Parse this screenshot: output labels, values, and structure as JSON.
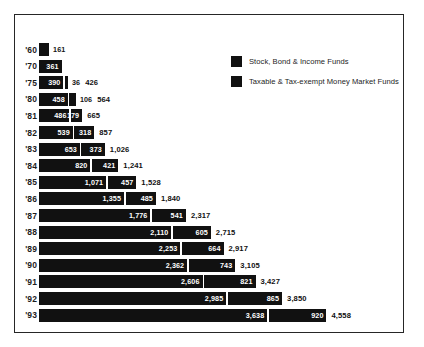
{
  "chart_data": {
    "type": "bar",
    "orientation": "horizontal",
    "stacked": true,
    "title": "",
    "xlabel": "",
    "ylabel": "",
    "grid": false,
    "legend_position": "top-right",
    "categories": [
      "'60",
      "'70",
      "'75",
      "'80",
      "'81",
      "'82",
      "'83",
      "'84",
      "'85",
      "'86",
      "'87",
      "'88",
      "'89",
      "'90",
      "'91",
      "'92",
      "'93"
    ],
    "series": [
      {
        "name": "Stock, Bond & Income Funds",
        "color": "#111111",
        "values": [
          161,
          361,
          390,
          458,
          486,
          539,
          653,
          820,
          1071,
          1355,
          1776,
          2110,
          2253,
          2362,
          2606,
          2985,
          3638
        ]
      },
      {
        "name": "Taxable & Tax-exempt Money Market Funds",
        "color": "#111111",
        "values": [
          null,
          null,
          36,
          106,
          179,
          318,
          373,
          421,
          457,
          485,
          541,
          605,
          664,
          743,
          821,
          865,
          920
        ]
      }
    ],
    "totals": [
      161,
      361,
      426,
      564,
      665,
      857,
      1026,
      1241,
      1528,
      1840,
      2317,
      2715,
      2917,
      3105,
      3427,
      3850,
      4558
    ],
    "xlim": [
      0,
      4558
    ]
  },
  "legend": {
    "items": [
      {
        "label": "Stock, Bond & Income Funds"
      },
      {
        "label": "Taxable & Tax-exempt Money Market Funds"
      }
    ]
  },
  "rows": [
    {
      "year": "'60",
      "v1": "161",
      "v2": "",
      "total": "",
      "v1_inside": false,
      "v2_inside": false,
      "show_total": false
    },
    {
      "year": "'70",
      "v1": "361",
      "v2": "",
      "total": "",
      "v1_inside": true,
      "v2_inside": false,
      "show_total": false
    },
    {
      "year": "'75",
      "v1": "390",
      "v2": "36",
      "total": "426",
      "v1_inside": true,
      "v2_inside": false,
      "show_total": true
    },
    {
      "year": "'80",
      "v1": "458",
      "v2": "106",
      "total": "564",
      "v1_inside": true,
      "v2_inside": false,
      "show_total": true
    },
    {
      "year": "'81",
      "v1": "486",
      "v2": "179",
      "total": "665",
      "v1_inside": true,
      "v2_inside": true,
      "show_total": true
    },
    {
      "year": "'82",
      "v1": "539",
      "v2": "318",
      "total": "857",
      "v1_inside": true,
      "v2_inside": true,
      "show_total": true
    },
    {
      "year": "'83",
      "v1": "653",
      "v2": "373",
      "total": "1,026",
      "v1_inside": true,
      "v2_inside": true,
      "show_total": true
    },
    {
      "year": "'84",
      "v1": "820",
      "v2": "421",
      "total": "1,241",
      "v1_inside": true,
      "v2_inside": true,
      "show_total": true
    },
    {
      "year": "'85",
      "v1": "1,071",
      "v2": "457",
      "total": "1,528",
      "v1_inside": true,
      "v2_inside": true,
      "show_total": true
    },
    {
      "year": "'86",
      "v1": "1,355",
      "v2": "485",
      "total": "1,840",
      "v1_inside": true,
      "v2_inside": true,
      "show_total": true
    },
    {
      "year": "'87",
      "v1": "1,776",
      "v2": "541",
      "total": "2,317",
      "v1_inside": true,
      "v2_inside": true,
      "show_total": true
    },
    {
      "year": "'88",
      "v1": "2,110",
      "v2": "605",
      "total": "2,715",
      "v1_inside": true,
      "v2_inside": true,
      "show_total": true
    },
    {
      "year": "'89",
      "v1": "2,253",
      "v2": "664",
      "total": "2,917",
      "v1_inside": true,
      "v2_inside": true,
      "show_total": true
    },
    {
      "year": "'90",
      "v1": "2,362",
      "v2": "743",
      "total": "3,105",
      "v1_inside": true,
      "v2_inside": true,
      "show_total": true
    },
    {
      "year": "'91",
      "v1": "2,606",
      "v2": "821",
      "total": "3,427",
      "v1_inside": true,
      "v2_inside": true,
      "show_total": true
    },
    {
      "year": "'92",
      "v1": "2,985",
      "v2": "865",
      "total": "3,850",
      "v1_inside": true,
      "v2_inside": true,
      "show_total": true
    },
    {
      "year": "'93",
      "v1": "3,638",
      "v2": "920",
      "total": "4,558",
      "v1_inside": true,
      "v2_inside": true,
      "show_total": true
    }
  ]
}
